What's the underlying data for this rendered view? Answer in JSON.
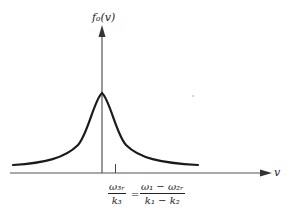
{
  "diagram": {
    "type": "lorentzian-distribution-plot",
    "y_axis_label": "f₀(v)",
    "x_axis_label": "v",
    "curve": "symmetric peaked resonance curve centered on vertical axis",
    "tick_marker_label": {
      "lhs_numerator": "ω₃ᵣ",
      "lhs_denominator": "k₃",
      "equals": "=",
      "rhs_numerator": "ω₁ − ω₂ᵣ",
      "rhs_denominator": "k₁ − k₂"
    },
    "colors": {
      "curve": "#1a1a1a",
      "axes": "#555555",
      "background": "#ffffff"
    }
  }
}
